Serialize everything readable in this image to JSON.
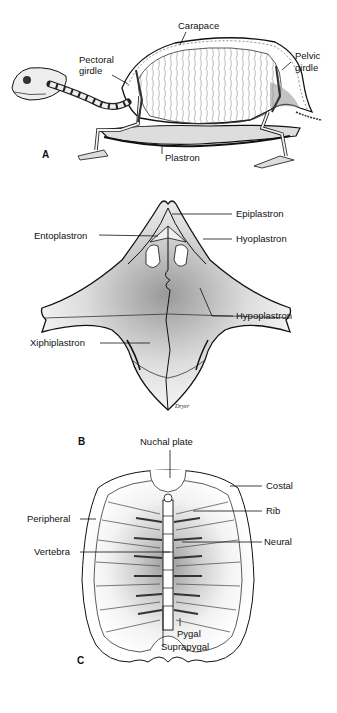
{
  "panel_a": {
    "letter": "A",
    "labels": {
      "carapace": "Carapace",
      "pectoral_1": "Pectoral",
      "pectoral_2": "girdle",
      "pelvic_1": "Pelvic",
      "pelvic_2": "girdle",
      "plastron": "Plastron"
    }
  },
  "panel_b": {
    "letter": "B",
    "signature": "Dryer",
    "labels": {
      "epiplastron": "Epiplastron",
      "entoplastron": "Entoplastron",
      "hyoplastron": "Hyoplastron",
      "hypoplastron": "Hypoplastron",
      "xiphiplastron": "Xiphiplastron"
    }
  },
  "panel_c": {
    "letter": "C",
    "labels": {
      "nuchal": "Nuchal plate",
      "costal": "Costal",
      "rib": "Rib",
      "peripheral": "Peripheral",
      "neural": "Neural",
      "vertebra": "Vertebra",
      "pygal": "Pygal",
      "suprapygal": "Suprapygal"
    }
  }
}
